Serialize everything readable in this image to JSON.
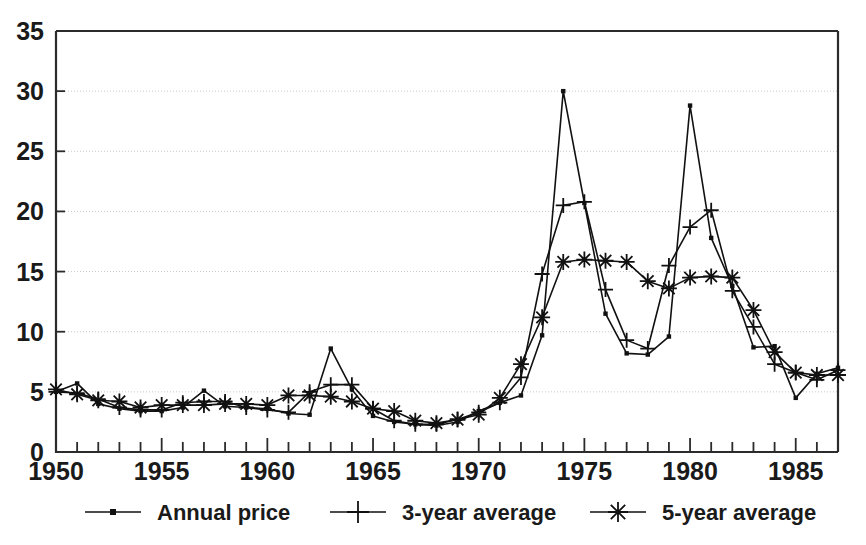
{
  "chart_data": {
    "type": "line",
    "title": "",
    "subtitle": "",
    "xlabel": "",
    "ylabel": "",
    "xlim": [
      1950,
      1987
    ],
    "ylim": [
      0,
      35
    ],
    "yticks": [
      0,
      5,
      10,
      15,
      20,
      25,
      30,
      35
    ],
    "ytick_labels": [
      "0",
      "5",
      "10",
      "15",
      "20",
      "25",
      "30",
      "35"
    ],
    "xticks": [
      1950,
      1955,
      1960,
      1965,
      1970,
      1975,
      1980,
      1985
    ],
    "xtick_labels": [
      "1950",
      "1955",
      "1960",
      "1965",
      "1970",
      "1975",
      "1980",
      "1985"
    ],
    "x_minor_tick_step": 1,
    "grid": "horizontal-dotted",
    "legend_position": "bottom-outside",
    "x": [
      1950,
      1951,
      1952,
      1953,
      1954,
      1955,
      1956,
      1957,
      1958,
      1959,
      1960,
      1961,
      1962,
      1963,
      1964,
      1965,
      1966,
      1967,
      1968,
      1969,
      1970,
      1971,
      1972,
      1973,
      1974,
      1975,
      1976,
      1977,
      1978,
      1979,
      1980,
      1981,
      1982,
      1983,
      1984,
      1985,
      1986,
      1987
    ],
    "series": [
      {
        "name": "Annual price",
        "marker": "small-dot",
        "values": [
          5.0,
          5.7,
          4.0,
          3.6,
          3.4,
          3.4,
          3.7,
          5.1,
          3.8,
          3.7,
          3.6,
          3.2,
          3.1,
          8.6,
          5.2,
          3.0,
          2.5,
          2.3,
          2.2,
          2.5,
          3.4,
          4.1,
          4.7,
          9.7,
          30.0,
          20.7,
          11.5,
          8.2,
          8.1,
          9.6,
          28.8,
          17.8,
          13.8,
          8.7,
          8.8,
          4.5,
          6.5,
          7.0
        ]
      },
      {
        "name": "3-year average",
        "marker": "plus",
        "values": [
          5.0,
          4.9,
          4.4,
          3.7,
          3.5,
          3.5,
          4.1,
          4.2,
          4.2,
          3.7,
          3.5,
          3.3,
          5.0,
          5.6,
          5.6,
          3.6,
          2.6,
          2.3,
          2.3,
          2.7,
          3.3,
          4.1,
          6.2,
          14.8,
          20.5,
          20.8,
          13.5,
          9.3,
          8.6,
          15.5,
          18.7,
          20.1,
          13.4,
          10.4,
          7.3,
          6.6,
          6.0,
          6.8
        ]
      },
      {
        "name": "5-year average",
        "marker": "asterisk",
        "values": [
          5.2,
          4.8,
          4.3,
          4.2,
          3.7,
          3.9,
          3.9,
          3.9,
          4.0,
          4.0,
          3.9,
          4.7,
          4.7,
          4.6,
          4.2,
          3.6,
          3.4,
          2.6,
          2.4,
          2.7,
          3.1,
          4.5,
          7.3,
          11.2,
          15.8,
          16.0,
          15.9,
          15.8,
          14.2,
          13.6,
          14.5,
          14.6,
          14.5,
          11.8,
          8.3,
          6.6,
          6.4,
          6.4
        ]
      }
    ]
  },
  "legend": {
    "items": [
      {
        "label": "Annual price",
        "marker": "small-dot"
      },
      {
        "label": "3-year average",
        "marker": "plus"
      },
      {
        "label": "5-year average",
        "marker": "asterisk"
      }
    ]
  }
}
